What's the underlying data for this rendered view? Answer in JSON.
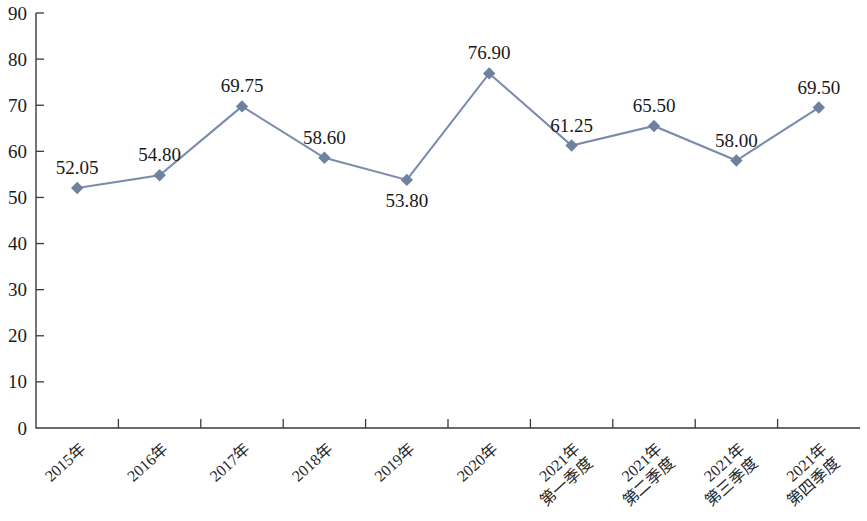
{
  "chart_data": {
    "type": "line",
    "title": "",
    "subtitle": "",
    "xlabel": "",
    "ylabel": "",
    "ylim": [
      0,
      90
    ],
    "ytick_step": 10,
    "yticks": [
      "0",
      "10",
      "20",
      "30",
      "40",
      "50",
      "60",
      "70",
      "80",
      "90"
    ],
    "grid": false,
    "legend": null,
    "legend_position": "none",
    "marker": "diamond",
    "series_color": "#6e819f",
    "line_color": "#7b8cab",
    "axis_color": "#3a3a3a",
    "background": "#ffffff",
    "categories": [
      "2015年",
      "2016年",
      "2017年",
      "2018年",
      "2019年",
      "2020年",
      "2021年\n第一季度",
      "2021年\n第二季度",
      "2021年\n第三季度",
      "2021年\n第四季度"
    ],
    "category_lines": [
      [
        "2015年"
      ],
      [
        "2016年"
      ],
      [
        "2017年"
      ],
      [
        "2018年"
      ],
      [
        "2019年"
      ],
      [
        "2020年"
      ],
      [
        "2021年",
        "第一季度"
      ],
      [
        "2021年",
        "第二季度"
      ],
      [
        "2021年",
        "第三季度"
      ],
      [
        "2021年",
        "第四季度"
      ]
    ],
    "values": [
      52.05,
      54.8,
      69.75,
      58.6,
      53.8,
      76.9,
      61.25,
      65.5,
      58.0,
      69.5
    ],
    "data_labels": [
      "52.05",
      "54.80",
      "69.75",
      "58.60",
      "53.80",
      "76.90",
      "61.25",
      "65.50",
      "58.00",
      "69.50"
    ],
    "data_label_positions": [
      "above",
      "above",
      "above",
      "above",
      "below",
      "above",
      "above",
      "above",
      "above",
      "above"
    ]
  }
}
